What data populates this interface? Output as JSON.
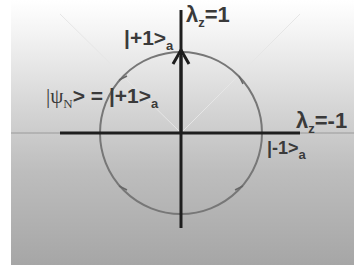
{
  "diagram": {
    "type": "bloch-circle",
    "labels": {
      "top_axis": {
        "lambda": "λ",
        "sub": "z",
        "value": "=1"
      },
      "right_axis": {
        "lambda": "λ",
        "sub": "z",
        "value": "=-1"
      },
      "top_state": {
        "ket": "|+1>",
        "sub": "a"
      },
      "right_state": {
        "ket": "|-1>",
        "sub": "a"
      },
      "psi": {
        "lhs": "|ψ",
        "lhs_sub": "N",
        "rhs": "> = |+1>",
        "rhs_sub": "a"
      }
    },
    "colors": {
      "axis": "#1e1e1e",
      "circle": "#707070",
      "text": "#3a3a3a",
      "diagonal": "#e8e8e8"
    }
  }
}
